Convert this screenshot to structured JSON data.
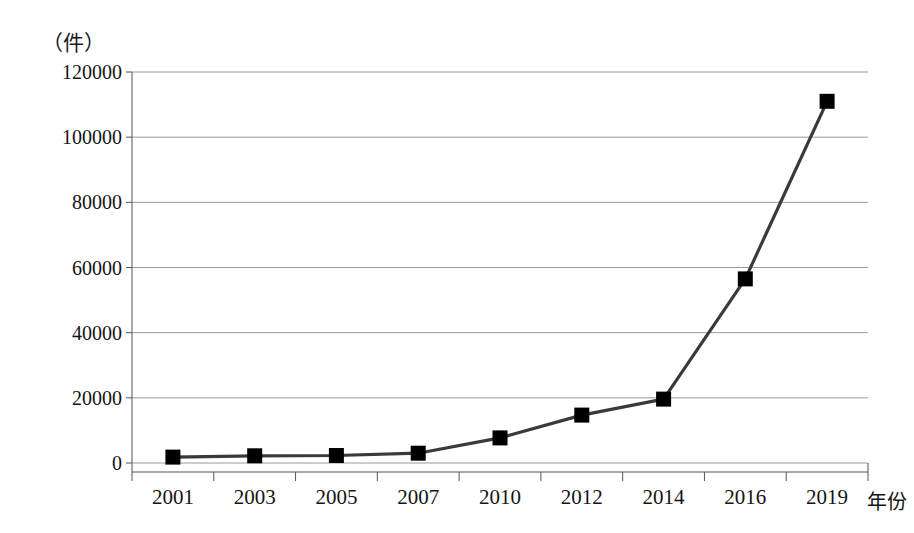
{
  "chart_data": {
    "type": "line",
    "title": "",
    "subtitle": "",
    "xlabel": "年份",
    "ylabel": "",
    "unit_label": "（件）",
    "categories": [
      "2001",
      "2003",
      "2005",
      "2007",
      "2010",
      "2012",
      "2014",
      "2016",
      "2019"
    ],
    "values": [
      1800,
      2200,
      2300,
      3000,
      7700,
      14700,
      19600,
      56500,
      111000
    ],
    "series": [
      {
        "name": "",
        "values": [
          1800,
          2200,
          2300,
          3000,
          7700,
          14700,
          19600,
          56500,
          111000
        ]
      }
    ],
    "ylim": [
      0,
      120000
    ],
    "yticks": [
      0,
      20000,
      40000,
      60000,
      80000,
      100000,
      120000
    ],
    "ytick_labels": [
      "0",
      "20000",
      "40000",
      "60000",
      "80000",
      "100000",
      "120000"
    ],
    "grid": true,
    "grid_axis": "y",
    "legend": false,
    "legend_position": "none",
    "marker": "square",
    "marker_color": "#000000",
    "line_color": "#3a3a3a",
    "grid_color": "#9a9a9a",
    "axis_color": "#555555",
    "background_color": "#ffffff"
  }
}
